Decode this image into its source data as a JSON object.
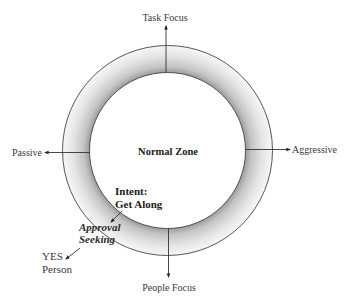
{
  "diagram": {
    "center_label": "Normal Zone",
    "axes": {
      "top": "Task Focus",
      "bottom": "People Focus",
      "left": "Passive",
      "right": "Aggressive"
    },
    "annotations": {
      "intent_line1": "Intent:",
      "intent_line2": "Get Along",
      "approval_line1": "Approval",
      "approval_line2": "Seeking",
      "yes_line1": "YES",
      "yes_line2": "Person"
    },
    "colors": {
      "ring_inner_shade": "#9a9a9a",
      "ring_outer_shade": "#f6f6f6",
      "line": "#333333",
      "text": "#3a3a3a"
    }
  }
}
